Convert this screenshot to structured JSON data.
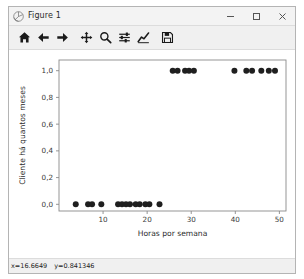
{
  "window": {
    "title": "Figure 1",
    "app_icon": "matplotlib-icon",
    "controls": {
      "minimize_label": "Minimize",
      "maximize_label": "Maximize",
      "close_label": "Close"
    }
  },
  "toolbar": {
    "buttons": [
      {
        "name": "home",
        "icon": "home-icon",
        "tooltip": "Reset original view"
      },
      {
        "name": "back",
        "icon": "arrow-left-icon",
        "tooltip": "Back to previous view"
      },
      {
        "name": "forward",
        "icon": "arrow-right-icon",
        "tooltip": "Forward to next view"
      },
      {
        "name": "pan",
        "icon": "move-arrows-icon",
        "tooltip": "Pan axes with left mouse, zoom with right"
      },
      {
        "name": "zoom",
        "icon": "magnifier-icon",
        "tooltip": "Zoom to rectangle"
      },
      {
        "name": "configure",
        "icon": "sliders-icon",
        "tooltip": "Configure subplots"
      },
      {
        "name": "edit-curves",
        "icon": "line-chart-icon",
        "tooltip": "Edit axis, curve and image parameters"
      },
      {
        "name": "save",
        "icon": "floppy-disk-icon",
        "tooltip": "Save the figure"
      }
    ]
  },
  "statusbar": {
    "x_readout": "x=16.6649",
    "y_readout": "y=0.841346"
  },
  "chart_data": {
    "type": "scatter",
    "title": "",
    "xlabel": "Horas por semana",
    "ylabel": "Cliente há quantos meses",
    "xlim": [
      0,
      51.5
    ],
    "ylim": [
      -0.05,
      1.08
    ],
    "xticks": [
      10,
      20,
      30,
      40,
      50
    ],
    "xtick_labels": [
      "10",
      "20",
      "30",
      "40",
      "50"
    ],
    "yticks": [
      0.0,
      0.2,
      0.4,
      0.6,
      0.8,
      1.0
    ],
    "ytick_labels": [
      "0,0",
      "0,2",
      "0,4",
      "0,6",
      "0,8",
      "1,0"
    ],
    "grid": false,
    "legend": null,
    "marker": "circle",
    "marker_color": "#1f1f1f",
    "marker_size": 3.0,
    "series": [
      {
        "name": "observations",
        "x": [
          3.8,
          6.6,
          7.5,
          9.6,
          13.4,
          14.3,
          15.2,
          16.1,
          17.4,
          18.3,
          19.6,
          20.5,
          22.8,
          25.8,
          26.9,
          28.6,
          29.5,
          30.6,
          39.8,
          42.5,
          43.8,
          45.9,
          47.6,
          49.0
        ],
        "y": [
          0,
          0,
          0,
          0,
          0,
          0,
          0,
          0,
          0,
          0,
          0,
          0,
          0,
          1,
          1,
          1,
          1,
          1,
          1,
          1,
          1,
          1,
          1,
          1
        ]
      }
    ]
  }
}
